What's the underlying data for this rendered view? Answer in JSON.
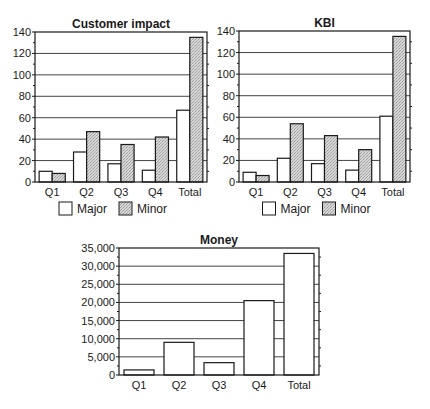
{
  "colors": {
    "major_fill": "#ffffff",
    "minor_fill": "#cfcfcf",
    "stroke": "#1a1a1a",
    "grid": "#444444"
  },
  "legend": {
    "major": "Major",
    "minor": "Minor"
  },
  "chart_data": [
    {
      "id": "customer-impact",
      "type": "bar",
      "title": "Customer impact",
      "xlabel": "",
      "ylabel": "",
      "categories": [
        "Q1",
        "Q2",
        "Q3",
        "Q4",
        "Total"
      ],
      "series": [
        {
          "name": "Major",
          "values": [
            10,
            28,
            17,
            11,
            67
          ]
        },
        {
          "name": "Minor",
          "values": [
            8,
            47,
            35,
            42,
            135
          ]
        }
      ],
      "ylim": [
        0,
        140
      ],
      "yticks": [
        0,
        20,
        40,
        60,
        80,
        100,
        120,
        140
      ],
      "ytick_labels": [
        "0",
        "20",
        "40",
        "60",
        "80",
        "100",
        "120",
        "140"
      ],
      "grid": true,
      "legend_position": "bottom",
      "frame": {
        "x": 35,
        "y": 32,
        "w": 172,
        "h": 150
      }
    },
    {
      "id": "kbi",
      "type": "bar",
      "title": "KBI",
      "xlabel": "",
      "ylabel": "",
      "categories": [
        "Q1",
        "Q2",
        "Q3",
        "Q4",
        "Total"
      ],
      "series": [
        {
          "name": "Major",
          "values": [
            9,
            22,
            17,
            11,
            61
          ]
        },
        {
          "name": "Minor",
          "values": [
            6,
            54,
            43,
            30,
            135
          ]
        }
      ],
      "ylim": [
        0,
        140
      ],
      "yticks": [
        0,
        20,
        40,
        60,
        80,
        100,
        120,
        140
      ],
      "ytick_labels": [
        "0",
        "20",
        "40",
        "60",
        "80",
        "100",
        "120",
        "140"
      ],
      "grid": true,
      "legend_position": "bottom",
      "frame": {
        "x": 239,
        "y": 31,
        "w": 171,
        "h": 151
      }
    },
    {
      "id": "money",
      "type": "bar",
      "title": "Money",
      "xlabel": "",
      "ylabel": "",
      "categories": [
        "Q1",
        "Q2",
        "Q3",
        "Q4",
        "Total"
      ],
      "series": [
        {
          "name": "Money",
          "values": [
            1400,
            9000,
            3400,
            20500,
            33500
          ]
        }
      ],
      "ylim": [
        0,
        35000
      ],
      "yticks": [
        0,
        5000,
        10000,
        15000,
        20000,
        25000,
        30000,
        35000
      ],
      "ytick_labels": [
        "0",
        "5,000",
        "10,000",
        "15,000",
        "20,000",
        "25,000",
        "30,000",
        "35,000"
      ],
      "grid": true,
      "legend_position": "none",
      "frame": {
        "x": 119,
        "y": 248,
        "w": 200,
        "h": 127
      }
    }
  ]
}
